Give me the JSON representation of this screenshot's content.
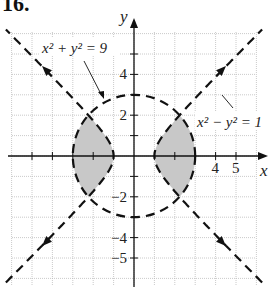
{
  "problem_number": "16.",
  "axes": {
    "x_label": "x",
    "y_label": "y"
  },
  "tick_labels": {
    "x": [
      {
        "v": 4,
        "t": "4"
      },
      {
        "v": 5,
        "t": "5"
      }
    ],
    "y": [
      {
        "v": 4,
        "t": "4"
      },
      {
        "v": 2,
        "t": "2"
      },
      {
        "v": -2,
        "t": "−2"
      },
      {
        "v": -4,
        "t": "−4"
      },
      {
        "v": -5,
        "t": "−5"
      }
    ]
  },
  "annotations": {
    "circle": "x² + y² = 9",
    "hyperbola": "x² − y² = 1"
  },
  "colors": {
    "shade": "#c8c8c8",
    "grid": "#bdbdbd",
    "ink": "#111111"
  },
  "chart_data": {
    "type": "region-graph",
    "title": "16.",
    "xlabel": "x",
    "ylabel": "y",
    "xlim": [
      -6,
      6
    ],
    "ylim": [
      -6.3,
      6
    ],
    "grid": true,
    "curves": [
      {
        "equation": "x^2 + y^2 = 9",
        "style": "dashed",
        "kind": "circle",
        "radius": 3
      },
      {
        "equation": "x^2 - y^2 = 1",
        "style": "dashed",
        "kind": "hyperbola",
        "asymptotes": [
          "y = x",
          "y = -x"
        ]
      }
    ],
    "shaded_region": "x^2 + y^2 < 9 and x^2 - y^2 > 1",
    "x_ticks": [
      4,
      5
    ],
    "y_ticks": [
      4,
      2,
      -2,
      -4,
      -5
    ]
  }
}
